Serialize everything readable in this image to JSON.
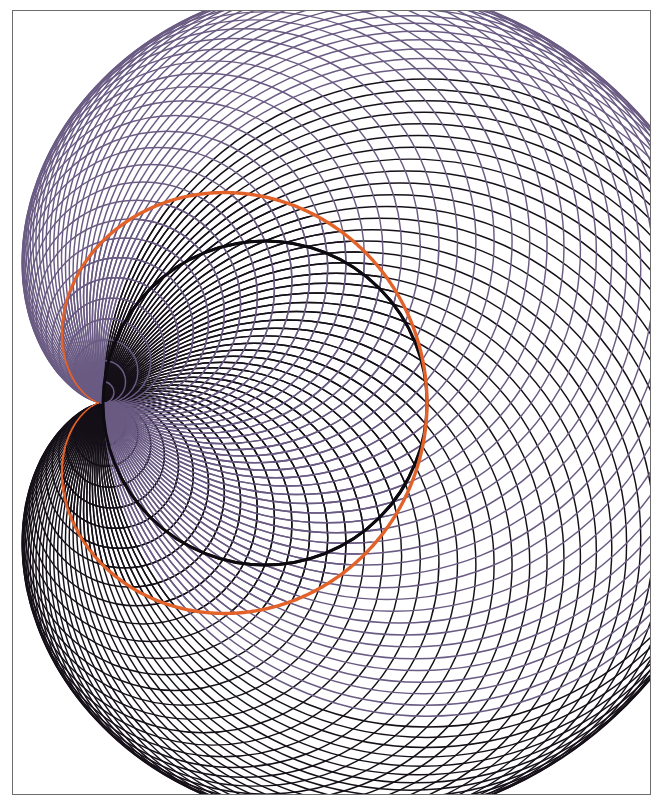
{
  "figure": {
    "width": 668,
    "height": 809,
    "background_color": "#ffffff"
  },
  "frame": {
    "label": "plot border",
    "x": 12,
    "y": 10,
    "width": 639,
    "height": 785,
    "stroke_color": "#6d6d6d",
    "stroke_width": 1.4,
    "fill_color": "#ffffff"
  },
  "chart_data": {
    "type": "line",
    "subtitle": "",
    "xlabel": "",
    "ylabel": "",
    "xlim": [
      12,
      651
    ],
    "ylim": [
      10,
      795
    ],
    "grid": false,
    "legend": "none",
    "tick_labels_x": [],
    "tick_labels_y": [],
    "annotations": [],
    "cusp_point": {
      "x": 103,
      "y": 403
    },
    "base_circle": {
      "cx": 265,
      "cy": 403,
      "r": 162
    },
    "cardioid": {
      "name": "envelope-cardioid",
      "color": "#e2622a",
      "stroke_width": 3.4,
      "cusp_x": 103,
      "cusp_y": 403,
      "a": 162,
      "max_x": 621,
      "min_y": 67,
      "max_y": 739,
      "orientation": "opens-right",
      "equation": "r = 2a(1 + cos(theta))"
    },
    "series": [
      {
        "name": "upper-family-black",
        "role": "generating circles, upper half",
        "color": "#151018",
        "stroke_width": 1.45,
        "count": 48,
        "theta_start_deg": 0,
        "theta_end_deg": 180,
        "description": "Circles centred on the base circle upper arc, each passing through the cusp point"
      },
      {
        "name": "lower-family-purple",
        "role": "generating circles, lower half",
        "color": "#6a5b83",
        "stroke_width": 1.45,
        "count": 48,
        "theta_start_deg": 180,
        "theta_end_deg": 360,
        "description": "Circles centred on the base circle lower arc, each passing through the cusp point"
      },
      {
        "name": "highlight-circle",
        "role": "accented member of the pencil",
        "color": "#0d0a10",
        "stroke_width": 3.0,
        "count": 1,
        "cx": 265,
        "cy": 403,
        "r": 162,
        "description": "The base circle itself, drawn thicker and darker than its neighbours"
      }
    ],
    "values": [],
    "categories": []
  },
  "palette": {
    "orange_envelope": "#e2622a",
    "black_family": "#151018",
    "purple_family": "#6a5b83",
    "frame_gray": "#6d6d6d",
    "paper_white": "#ffffff"
  }
}
